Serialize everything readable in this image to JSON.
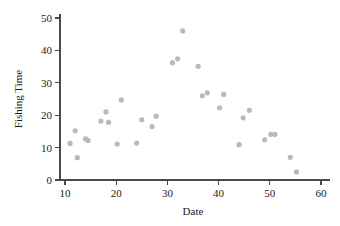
{
  "chart_data": {
    "type": "scatter",
    "title": "",
    "xlabel": "Date",
    "ylabel": "Fishing Time",
    "xlim": [
      8,
      61
    ],
    "ylim": [
      0,
      51
    ],
    "xticks": [
      10,
      20,
      30,
      40,
      50,
      60
    ],
    "yticks": [
      0,
      10,
      20,
      30,
      40,
      50
    ],
    "xtick_labels": [
      "10",
      "20",
      "30",
      "40",
      "50",
      "60"
    ],
    "ytick_labels": [
      "0",
      "10",
      "20",
      "30",
      "40",
      "50"
    ],
    "grid": false,
    "legend": null,
    "marker": {
      "shape": "circle",
      "color": "#b9b9b9",
      "size": 2.6
    },
    "points": [
      {
        "x": 11.0,
        "y": 11.3
      },
      {
        "x": 12.0,
        "y": 15.2
      },
      {
        "x": 12.4,
        "y": 6.9
      },
      {
        "x": 14.0,
        "y": 12.7
      },
      {
        "x": 14.5,
        "y": 12.2
      },
      {
        "x": 17.0,
        "y": 18.2
      },
      {
        "x": 18.0,
        "y": 21.0
      },
      {
        "x": 18.5,
        "y": 17.8
      },
      {
        "x": 20.2,
        "y": 11.1
      },
      {
        "x": 21.0,
        "y": 24.7
      },
      {
        "x": 24.0,
        "y": 11.4
      },
      {
        "x": 25.0,
        "y": 18.6
      },
      {
        "x": 27.0,
        "y": 16.5
      },
      {
        "x": 27.8,
        "y": 19.7
      },
      {
        "x": 31.0,
        "y": 36.2
      },
      {
        "x": 32.0,
        "y": 37.4
      },
      {
        "x": 33.0,
        "y": 46.0
      },
      {
        "x": 36.0,
        "y": 35.1
      },
      {
        "x": 36.8,
        "y": 26.0
      },
      {
        "x": 37.8,
        "y": 26.9
      },
      {
        "x": 40.2,
        "y": 22.3
      },
      {
        "x": 41.0,
        "y": 26.4
      },
      {
        "x": 44.0,
        "y": 10.9
      },
      {
        "x": 44.8,
        "y": 19.2
      },
      {
        "x": 46.0,
        "y": 21.5
      },
      {
        "x": 49.0,
        "y": 12.4
      },
      {
        "x": 50.2,
        "y": 14.1
      },
      {
        "x": 51.0,
        "y": 14.1
      },
      {
        "x": 54.0,
        "y": 7.0
      },
      {
        "x": 55.2,
        "y": 2.5
      }
    ]
  }
}
